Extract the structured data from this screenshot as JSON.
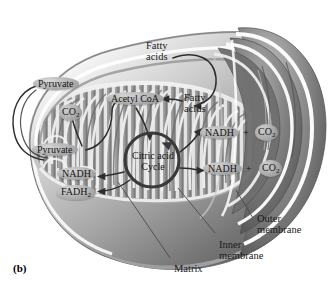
{
  "figure": {
    "panel_label": "(b)",
    "background_color": "#ffffff"
  },
  "colors": {
    "outer_membrane": "#8e8e8e",
    "inner_membrane": "#b9b9b9",
    "matrix": "#9a9a9a",
    "cristae_light": "#e6e6e6",
    "cristae_dark": "#7c7c7c",
    "bubble_fill": "#a8a8a8",
    "arrow": "#3a3a3a",
    "text": "#141414",
    "leader_line": "#555555"
  },
  "molecules": [
    {
      "id": "pyruvate-outer",
      "label": "Pyruvate",
      "shape": "ellipse"
    },
    {
      "id": "pyruvate-inner",
      "label": "Pyruvate",
      "shape": "ellipse"
    },
    {
      "id": "co2-left",
      "label": "CO",
      "subscript": "2",
      "shape": "circle"
    },
    {
      "id": "acetyl-coa",
      "label": "Acetyl CoA",
      "shape": "ellipse"
    },
    {
      "id": "nadh-left",
      "label": "NADH",
      "shape": "ellipse"
    },
    {
      "id": "fadh2",
      "label": "FADH",
      "subscript": "2",
      "shape": "ellipse"
    },
    {
      "id": "nadh-right-top",
      "label": "NADH",
      "shape": "ellipse"
    },
    {
      "id": "co2-right-top",
      "label": "CO",
      "subscript": "2",
      "shape": "circle"
    },
    {
      "id": "nadh-right-bottom",
      "label": "NADH",
      "shape": "ellipse"
    },
    {
      "id": "co2-right-bottom",
      "label": "CO",
      "subscript": "2",
      "shape": "circle"
    }
  ],
  "plus_signs": [
    {
      "id": "plus-top",
      "label": "+"
    },
    {
      "id": "plus-bottom",
      "label": "+"
    }
  ],
  "cycle": {
    "line1": "Citric acid",
    "line2": "Cycle"
  },
  "inputs": [
    {
      "id": "fatty-acids-top",
      "line1": "Fatty",
      "line2": "acids"
    },
    {
      "id": "fatty-acids-inner",
      "line1": "Fatty",
      "line2": "acids"
    }
  ],
  "structure_callouts": [
    {
      "id": "outer-membrane",
      "line1": "Outer",
      "line2": "membrane"
    },
    {
      "id": "inner-membrane",
      "line1": "Inner",
      "line2": "membrane"
    },
    {
      "id": "matrix",
      "line1": "Matrix",
      "line2": ""
    }
  ]
}
